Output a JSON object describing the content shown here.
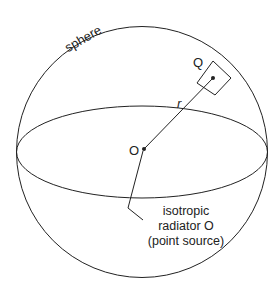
{
  "diagram": {
    "sphere_label": "sphere",
    "point_q_label": "Q",
    "radius_label": "r",
    "origin_label": "O",
    "annotation": {
      "line1": "isotropic",
      "line2": "radiator O",
      "line3": "(point source)"
    },
    "colors": {
      "stroke": "#222222",
      "background": "#ffffff"
    }
  }
}
